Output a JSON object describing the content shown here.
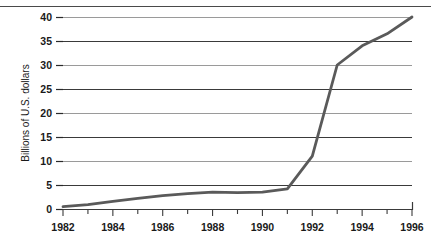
{
  "chart_data": {
    "type": "line",
    "title": "",
    "xlabel": "",
    "ylabel": "Billions of U.S. dollars",
    "xlim": [
      1982,
      1996
    ],
    "ylim": [
      0,
      40
    ],
    "grid": true,
    "legend": "none",
    "x_tick_labels": [
      "1982",
      "1984",
      "1986",
      "1988",
      "1990",
      "1992",
      "1994",
      "1996"
    ],
    "x_minor_ticks": [
      1983,
      1985,
      1987,
      1989,
      1991,
      1993,
      1995
    ],
    "y_tick_labels": [
      "0",
      "5",
      "10",
      "15",
      "20",
      "25",
      "30",
      "35",
      "40"
    ],
    "y_ticks": [
      0,
      5,
      10,
      15,
      20,
      25,
      30,
      35,
      40
    ],
    "series": [
      {
        "name": "U.S. dollars",
        "color": "#5a5a5a",
        "x": [
          1982,
          1983,
          1984,
          1985,
          1986,
          1987,
          1988,
          1989,
          1990,
          1991,
          1992,
          1993,
          1994,
          1995,
          1996
        ],
        "values": [
          0.5,
          0.9,
          1.6,
          2.2,
          2.8,
          3.2,
          3.5,
          3.4,
          3.5,
          4.2,
          11.0,
          30.0,
          34.0,
          36.5,
          40.0
        ]
      }
    ]
  },
  "axes": {
    "y_axis_title": "Billions of U.S. dollars"
  }
}
